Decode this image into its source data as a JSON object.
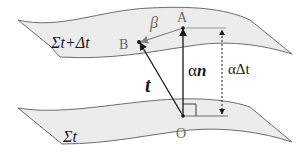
{
  "diagram": {
    "surfaces": {
      "upper": {
        "label": "Σt+Δt",
        "fill": "#ececec",
        "stroke": "#6e6e6e"
      },
      "lower": {
        "label": "Σt",
        "fill": "#ececec",
        "stroke": "#6e6e6e"
      }
    },
    "points": {
      "A": {
        "label": "A"
      },
      "B": {
        "label": "B"
      },
      "O": {
        "label": "O"
      }
    },
    "vectors": {
      "shift": {
        "label": "β",
        "color": "#777777"
      },
      "tangent": {
        "label": "t",
        "color": "#1a1a1a"
      },
      "normal": {
        "label_prefix": "α",
        "label_vector": "n",
        "color": "#1a1a1a"
      }
    },
    "distance": {
      "label": "αΔt",
      "style": "dotted"
    },
    "right_angle_marker": true
  }
}
